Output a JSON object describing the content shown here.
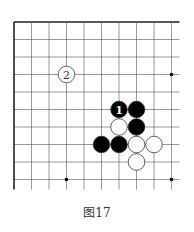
{
  "diagram": {
    "caption": "图17",
    "board": {
      "columns": 10,
      "rows": 10,
      "closed_edges": [
        "top",
        "left"
      ],
      "open_edges": [
        "right",
        "bottom"
      ]
    },
    "star_points": [
      {
        "col": 9,
        "row": 3
      },
      {
        "col": 3,
        "row": 9
      },
      {
        "col": 9,
        "row": 9
      }
    ],
    "stones": [
      {
        "color": "black",
        "col": 6,
        "row": 5,
        "label": "1"
      },
      {
        "color": "black",
        "col": 7,
        "row": 5,
        "label": ""
      },
      {
        "color": "white",
        "col": 6,
        "row": 6,
        "label": ""
      },
      {
        "color": "black",
        "col": 7,
        "row": 6,
        "label": ""
      },
      {
        "color": "black",
        "col": 5,
        "row": 7,
        "label": ""
      },
      {
        "color": "black",
        "col": 6,
        "row": 7,
        "label": ""
      },
      {
        "color": "white",
        "col": 7,
        "row": 7,
        "label": ""
      },
      {
        "color": "white",
        "col": 8,
        "row": 7,
        "label": ""
      },
      {
        "color": "white",
        "col": 7,
        "row": 8,
        "label": ""
      },
      {
        "color": "white",
        "col": 3,
        "row": 3,
        "label": "2"
      }
    ],
    "colors": {
      "line": "#555555",
      "border": "#222222",
      "black_stone": "#000000",
      "white_stone": "#ffffff",
      "black_label": "#ffffff",
      "white_label": "#333333"
    }
  }
}
